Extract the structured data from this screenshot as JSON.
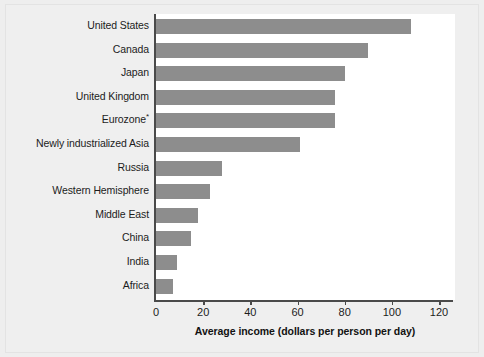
{
  "chart_data": {
    "type": "bar",
    "orientation": "horizontal",
    "title": "",
    "xlabel": "Average income (dollars per person per day)",
    "ylabel": "",
    "xlim": [
      0,
      128
    ],
    "xticks": [
      0,
      20,
      40,
      60,
      80,
      100,
      120
    ],
    "xtick_labels": [
      "0",
      "20",
      "40",
      "60",
      "80",
      "100",
      "120"
    ],
    "grid": false,
    "legend": null,
    "bar_color": "#8d8d8d",
    "plot_background": "#ffffff",
    "page_background": "#efefef",
    "axis_color": "#4a4a4a",
    "footnote_marker": "*",
    "categories": [
      "United States",
      "Canada",
      "Japan",
      "United Kingdom",
      "Eurozone*",
      "Newly industrialized Asia",
      "Russia",
      "Western Hemisphere",
      "Middle East",
      "China",
      "India",
      "Africa"
    ],
    "values": [
      108,
      90,
      80,
      76,
      76,
      61,
      28,
      23,
      18,
      15,
      9,
      7
    ],
    "bars": [
      {
        "label": "United States",
        "value": 108
      },
      {
        "label": "Canada",
        "value": 90
      },
      {
        "label": "Japan",
        "value": 80
      },
      {
        "label": "United Kingdom",
        "value": 76
      },
      {
        "label": "Eurozone",
        "superscript": "*",
        "value": 76
      },
      {
        "label": "Newly industrialized Asia",
        "value": 61
      },
      {
        "label": "Russia",
        "value": 28
      },
      {
        "label": "Western Hemisphere",
        "value": 23
      },
      {
        "label": "Middle East",
        "value": 18
      },
      {
        "label": "China",
        "value": 15
      },
      {
        "label": "India",
        "value": 9
      },
      {
        "label": "Africa",
        "value": 7
      }
    ]
  }
}
